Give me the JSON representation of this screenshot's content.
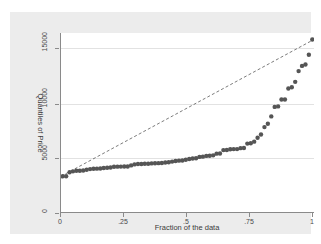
{
  "chart_data": {
    "type": "scatter",
    "title": "",
    "subtitle": "",
    "xlabel": "Fraction of the data",
    "ylabel": "Quantiles of Price",
    "xlim": [
      0,
      1
    ],
    "ylim": [
      0,
      16500
    ],
    "xticks": [
      "0",
      ".25",
      ".5",
      ".75",
      "1"
    ],
    "xtickvalues": [
      0,
      0.25,
      0.5,
      0.75,
      1
    ],
    "yticks": [
      "0",
      "5000",
      "10000",
      "15000"
    ],
    "ytickvalues": [
      0,
      5000,
      10000,
      15000
    ],
    "grid": "horizontal",
    "legend": "none",
    "marker": {
      "shape": "circle",
      "color": "#555555",
      "size": 2.2
    },
    "series": [
      {
        "name": "Quantiles of Price",
        "type": "scatter",
        "x": [
          0.0068,
          0.0203,
          0.0338,
          0.0473,
          0.0608,
          0.0743,
          0.0878,
          0.1014,
          0.1149,
          0.1284,
          0.1419,
          0.1554,
          0.1689,
          0.1824,
          0.1959,
          0.2095,
          0.223,
          0.2365,
          0.25,
          0.2635,
          0.277,
          0.2905,
          0.3041,
          0.3176,
          0.3311,
          0.3446,
          0.3581,
          0.3716,
          0.3851,
          0.3986,
          0.4122,
          0.4257,
          0.4392,
          0.4527,
          0.4662,
          0.4797,
          0.4932,
          0.5068,
          0.5203,
          0.5338,
          0.5473,
          0.5608,
          0.5743,
          0.5878,
          0.6014,
          0.6149,
          0.6284,
          0.6419,
          0.6554,
          0.6689,
          0.6824,
          0.6959,
          0.7095,
          0.723,
          0.7365,
          0.75,
          0.7635,
          0.777,
          0.7905,
          0.8041,
          0.8176,
          0.8311,
          0.8446,
          0.8581,
          0.8716,
          0.8851,
          0.8986,
          0.9122,
          0.9257,
          0.9392,
          0.9527,
          0.9662,
          0.9797,
          0.9932
        ],
        "y": [
          3291,
          3299,
          3667,
          3748,
          3798,
          3799,
          3829,
          3895,
          3955,
          3984,
          3995,
          4010,
          4060,
          4082,
          4099,
          4172,
          4181,
          4187,
          4195,
          4196,
          4296,
          4389,
          4424,
          4425,
          4452,
          4453,
          4482,
          4499,
          4504,
          4516,
          4563,
          4589,
          4647,
          4697,
          4733,
          4749,
          4816,
          4886,
          4934,
          4959,
          5079,
          5104,
          5172,
          5189,
          5222,
          5379,
          5399,
          5705,
          5719,
          5788,
          5798,
          5799,
          5886,
          5899,
          6303,
          6342,
          6486,
          6850,
          7140,
          7827,
          8129,
          8814,
          9690,
          9735,
          10371,
          10372,
          11385,
          11497,
          11995,
          12990,
          13466,
          13594,
          14500,
          15906
        ]
      },
      {
        "name": "reference line",
        "type": "line",
        "style": "dashed",
        "color": "#444444",
        "x": [
          0,
          1
        ],
        "y": [
          3291,
          15906
        ]
      }
    ]
  },
  "axes": {
    "xtitle": "Fraction of the data",
    "ytitle": "Quantiles of Price",
    "xticklabels": [
      "0",
      ".25",
      ".5",
      ".75",
      "1"
    ],
    "yticklabels": [
      "0",
      "5000",
      "10000",
      "15000"
    ]
  },
  "colors": {
    "figure_background": "#ececec",
    "plot_background": "#ffffff",
    "gridline": "#e2e2e2",
    "axis": "#8a8a8a",
    "marker": "#555555",
    "refline": "#444444",
    "text": "#3a3a3a"
  }
}
